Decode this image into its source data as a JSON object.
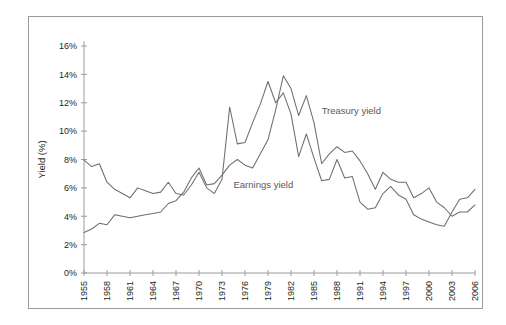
{
  "chart_data": {
    "type": "line",
    "title": "",
    "xlabel": "",
    "ylabel": "Yield (%)",
    "ylim": [
      0,
      16
    ],
    "xlim": [
      1955,
      2006
    ],
    "ytick_labels": [
      "0%",
      "2%",
      "4%",
      "6%",
      "8%",
      "10%",
      "12%",
      "14%",
      "16%"
    ],
    "ytick_values": [
      0,
      2,
      4,
      6,
      8,
      10,
      12,
      14,
      16
    ],
    "xtick_labels": [
      "1955",
      "1958",
      "1961",
      "1964",
      "1967",
      "1970",
      "1973",
      "1976",
      "1979",
      "1982",
      "1985",
      "1988",
      "1991",
      "1994",
      "1997",
      "2000",
      "2003",
      "2006"
    ],
    "xtick_values": [
      1955,
      1958,
      1961,
      1964,
      1967,
      1970,
      1973,
      1976,
      1979,
      1982,
      1985,
      1988,
      1991,
      1994,
      1997,
      2000,
      2003,
      2006
    ],
    "grid": false,
    "legend_position": "inline-annotation",
    "x": [
      1955,
      1956,
      1957,
      1958,
      1959,
      1960,
      1961,
      1962,
      1963,
      1964,
      1965,
      1966,
      1967,
      1968,
      1969,
      1970,
      1971,
      1972,
      1973,
      1974,
      1975,
      1976,
      1977,
      1978,
      1979,
      1980,
      1981,
      1982,
      1983,
      1984,
      1985,
      1986,
      1987,
      1988,
      1989,
      1990,
      1991,
      1992,
      1993,
      1994,
      1995,
      1996,
      1997,
      1998,
      1999,
      2000,
      2001,
      2002,
      2003,
      2004,
      2005,
      2006
    ],
    "series": [
      {
        "name": "Earnings yield",
        "color": "#6d6e71",
        "values": [
          7.95,
          7.5,
          7.7,
          6.4,
          5.9,
          5.6,
          5.3,
          6.0,
          5.8,
          5.6,
          5.7,
          6.4,
          5.6,
          5.5,
          6.2,
          7.1,
          6.0,
          5.6,
          6.6,
          11.7,
          9.1,
          9.2,
          10.6,
          11.9,
          13.5,
          12.0,
          12.7,
          11.2,
          8.2,
          9.8,
          8.1,
          6.5,
          6.6,
          8.0,
          6.7,
          6.8,
          5.0,
          4.5,
          4.6,
          5.6,
          6.1,
          5.5,
          5.2,
          4.1,
          3.8,
          3.6,
          3.4,
          3.3,
          4.3,
          5.2,
          5.3,
          5.9
        ]
      },
      {
        "name": "Treasury yield",
        "color": "#6d6e71",
        "values": [
          2.85,
          3.1,
          3.5,
          3.4,
          4.1,
          4.0,
          3.9,
          4.0,
          4.1,
          4.2,
          4.3,
          4.9,
          5.1,
          5.7,
          6.7,
          7.4,
          6.2,
          6.3,
          6.9,
          7.6,
          8.0,
          7.6,
          7.4,
          8.4,
          9.4,
          11.5,
          13.9,
          13.0,
          11.1,
          12.5,
          10.6,
          7.7,
          8.4,
          8.9,
          8.5,
          8.6,
          7.9,
          7.0,
          5.9,
          7.1,
          6.6,
          6.4,
          6.4,
          5.3,
          5.6,
          6.0,
          5.0,
          4.6,
          4.0,
          4.3,
          4.3,
          4.8
        ]
      }
    ],
    "annotations": [
      {
        "text": "Treasury yield",
        "x": 1986,
        "y": 11.2
      },
      {
        "text": "Earnings yield",
        "x": 1974.5,
        "y": 6.0
      }
    ]
  }
}
